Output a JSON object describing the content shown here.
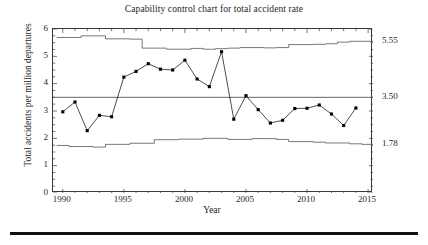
{
  "chart_data": {
    "type": "line",
    "title": "Capability control chart for total accident rate",
    "xlabel": "Year",
    "ylabel": "Total accidents per million departures",
    "xlim": [
      1989.2,
      2015.4
    ],
    "ylim": [
      0,
      6
    ],
    "grid": false,
    "legend": null,
    "y_ticks": [
      0,
      1,
      2,
      3,
      4,
      5,
      6
    ],
    "y_tick_labels": [
      "0",
      "1",
      "2",
      "3",
      "4",
      "5",
      "6"
    ],
    "x_ticks": [
      1990,
      1995,
      2000,
      2005,
      2010,
      2015
    ],
    "x_tick_labels": [
      "1990",
      "1995",
      "2000",
      "2005",
      "2010",
      "2015"
    ],
    "x": [
      1990,
      1991,
      1992,
      1993,
      1994,
      1995,
      1996,
      1997,
      1998,
      1999,
      2000,
      2001,
      2002,
      2003,
      2004,
      2005,
      2006,
      2007,
      2008,
      2009,
      2010,
      2011,
      2012,
      2013,
      2014
    ],
    "series": [
      {
        "name": "Total accident rate",
        "marker": "filled-square",
        "color": "#000000",
        "values": [
          2.97,
          3.33,
          2.28,
          2.84,
          2.79,
          4.24,
          4.45,
          4.73,
          4.53,
          4.5,
          4.86,
          4.17,
          3.89,
          5.17,
          2.7,
          3.56,
          3.05,
          2.56,
          2.66,
          3.09,
          3.1,
          3.22,
          2.89,
          2.47,
          3.11
        ]
      }
    ],
    "center_line": {
      "name": "Center line (CL)",
      "value": 3.5,
      "label": "3.50",
      "color": "#555555"
    },
    "upper_control_limit": {
      "name": "Upper control limit (UCL)",
      "label": "5.55",
      "end_value": 5.55,
      "style": "stepped",
      "color": "#555555",
      "values": [
        5.69,
        5.69,
        5.75,
        5.75,
        5.64,
        5.64,
        5.63,
        5.3,
        5.3,
        5.26,
        5.26,
        5.29,
        5.26,
        5.28,
        5.3,
        5.32,
        5.32,
        5.31,
        5.32,
        5.43,
        5.43,
        5.44,
        5.46,
        5.52,
        5.55,
        5.55
      ]
    },
    "lower_control_limit": {
      "name": "Lower control limit (LCL)",
      "label": "1.78",
      "end_value": 1.78,
      "style": "stepped",
      "color": "#555555",
      "values": [
        1.74,
        1.7,
        1.7,
        1.68,
        1.78,
        1.78,
        1.82,
        1.82,
        1.95,
        1.95,
        1.97,
        1.97,
        2.0,
        2.0,
        1.96,
        1.96,
        1.99,
        1.99,
        1.96,
        1.88,
        1.88,
        1.86,
        1.83,
        1.83,
        1.8,
        1.78
      ]
    },
    "annotations": [
      {
        "name": "ucl-right-label",
        "text": "5.55",
        "value": 5.55
      },
      {
        "name": "cl-right-label",
        "text": "3.50",
        "value": 3.5
      },
      {
        "name": "lcl-right-label",
        "text": "1.78",
        "value": 1.78
      }
    ]
  }
}
